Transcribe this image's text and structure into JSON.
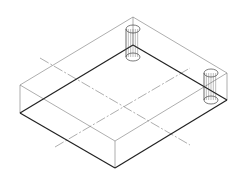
{
  "diagram": {
    "title": "",
    "type": "isometric-wireframe",
    "colors": {
      "background": "#ffffff",
      "line": "#333333",
      "thin": "#777777"
    },
    "box": {
      "top_back": [
        133,
        17
      ],
      "top_left": [
        20,
        85
      ],
      "top_right": [
        227,
        73
      ],
      "top_front": [
        115,
        141
      ],
      "bottom_left": [
        20,
        113
      ],
      "bottom_front": [
        115,
        168
      ],
      "bottom_right": [
        227,
        100
      ],
      "bottom_back": [
        133,
        45
      ]
    },
    "cylinders": [
      {
        "name": "cylinder-left",
        "cx": 133,
        "top_y": 29,
        "bottom_y": 57,
        "rx": 7,
        "ry": 4
      },
      {
        "name": "cylinder-right",
        "cx": 211,
        "top_y": 73,
        "bottom_y": 100,
        "rx": 7,
        "ry": 4
      }
    ],
    "centerlines": [
      {
        "from": [
          40,
          58
        ],
        "to": [
          190,
          145
        ]
      },
      {
        "from": [
          55,
          147
        ],
        "to": [
          190,
          68
        ]
      }
    ]
  }
}
